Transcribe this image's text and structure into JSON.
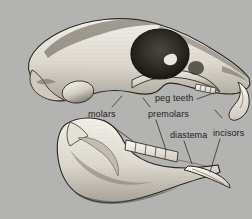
{
  "figure": {
    "background_color": "#b3b3b2",
    "label_color": "#1e1e1e",
    "bone_light_color": "#eceae4",
    "bone_mid_color": "#b9b4a9",
    "bone_shadow_color": "#6f6a60",
    "orbit_color": "#2b2823",
    "outline_color": "#2a2721",
    "leader_line_color": "#3a3732"
  },
  "labels": [
    {
      "id": "molars",
      "text": "molars",
      "x": 88,
      "y": 109
    },
    {
      "id": "peg_teeth",
      "text": "peg teeth",
      "x": 155,
      "y": 93
    },
    {
      "id": "premolars",
      "text": "premolars",
      "x": 148,
      "y": 109
    },
    {
      "id": "diastema",
      "text": "diastema",
      "x": 170,
      "y": 130
    },
    {
      "id": "incisors",
      "text": "incisors",
      "x": 213,
      "y": 128
    }
  ],
  "structures": [
    {
      "id": "cranium",
      "name": "cranium"
    },
    {
      "id": "orbit",
      "name": "eye socket"
    },
    {
      "id": "rostrum",
      "name": "snout / rostrum"
    },
    {
      "id": "upper_incisors",
      "name": "upper incisors"
    },
    {
      "id": "mandible",
      "name": "mandible / lower jaw"
    },
    {
      "id": "lower_incisor",
      "name": "lower incisor"
    },
    {
      "id": "cheek_teeth",
      "name": "lower cheek tooth row"
    }
  ]
}
